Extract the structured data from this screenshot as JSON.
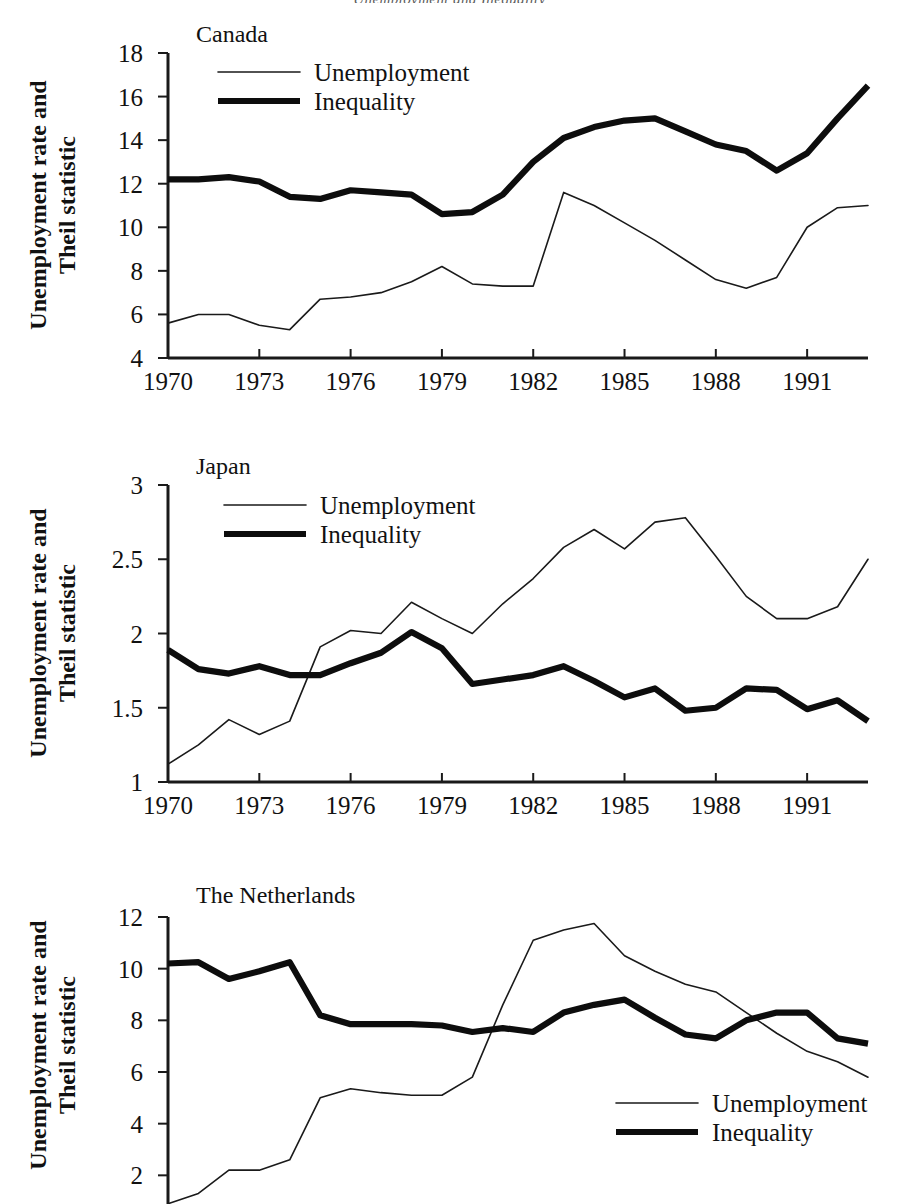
{
  "document": {
    "running_header": "Unemployment and Inequality"
  },
  "common": {
    "y_axis_title_line1": "Unemployment rate and",
    "y_axis_title_line2": "Theil statistic",
    "legend": {
      "unemployment_label": "Unemployment",
      "inequality_label": "Inequality",
      "unemployment_swatch": "thin-line-swatch",
      "inequality_swatch": "thick-line-swatch"
    },
    "x_tick_labels": [
      "1970",
      "1973",
      "1976",
      "1979",
      "1982",
      "1985",
      "1988",
      "1991"
    ],
    "colors": {
      "ink": "#111111",
      "unemployment_line": "#1a1a1a",
      "inequality_line": "#0d0d0d",
      "background": "#ffffff"
    }
  },
  "chart_data": [
    {
      "type": "line",
      "title": "Canada",
      "xlabel": "",
      "ylabel": "Unemployment rate and Theil statistic",
      "xlim": [
        1970,
        1993
      ],
      "ylim": [
        4,
        18
      ],
      "y_ticks": [
        4,
        6,
        8,
        10,
        12,
        14,
        16,
        18
      ],
      "x_ticks": [
        1970,
        1973,
        1976,
        1979,
        1982,
        1985,
        1988,
        1991
      ],
      "grid": false,
      "legend_position": "top-left-inside",
      "x": [
        1970,
        1971,
        1972,
        1973,
        1974,
        1975,
        1976,
        1977,
        1978,
        1979,
        1980,
        1981,
        1982,
        1983,
        1984,
        1985,
        1986,
        1987,
        1988,
        1989,
        1990,
        1991,
        1992,
        1993
      ],
      "series": [
        {
          "name": "Unemployment",
          "values": [
            5.6,
            6.0,
            6.0,
            5.5,
            5.3,
            6.7,
            6.8,
            7.0,
            7.5,
            8.2,
            7.4,
            7.3,
            7.3,
            11.6,
            11.0,
            10.2,
            9.4,
            8.5,
            7.6,
            7.2,
            7.7,
            10.0,
            10.9,
            11.0
          ]
        },
        {
          "name": "Inequality",
          "values": [
            12.2,
            12.2,
            12.3,
            12.1,
            11.4,
            11.3,
            11.7,
            11.6,
            11.5,
            10.6,
            10.7,
            11.5,
            13.0,
            14.1,
            14.6,
            14.9,
            15.0,
            14.4,
            13.8,
            13.5,
            12.6,
            13.4,
            15.0,
            16.5
          ]
        }
      ]
    },
    {
      "type": "line",
      "title": "Japan",
      "xlabel": "",
      "ylabel": "Unemployment rate and Theil statistic",
      "xlim": [
        1970,
        1993
      ],
      "ylim": [
        1,
        3
      ],
      "y_ticks": [
        1,
        1.5,
        2,
        2.5,
        3
      ],
      "y_tick_labels": [
        "1",
        "1.5",
        "2",
        "2.5",
        "3"
      ],
      "x_ticks": [
        1970,
        1973,
        1976,
        1979,
        1982,
        1985,
        1988,
        1991
      ],
      "grid": false,
      "legend_position": "top-left-inside",
      "x": [
        1970,
        1971,
        1972,
        1973,
        1974,
        1975,
        1976,
        1977,
        1978,
        1979,
        1980,
        1981,
        1982,
        1983,
        1984,
        1985,
        1986,
        1987,
        1988,
        1989,
        1990,
        1991,
        1992,
        1993
      ],
      "series": [
        {
          "name": "Unemployment",
          "values": [
            1.12,
            1.25,
            1.42,
            1.32,
            1.41,
            1.91,
            2.02,
            2.0,
            2.21,
            2.1,
            2.0,
            2.2,
            2.37,
            2.58,
            2.7,
            2.57,
            2.75,
            2.78,
            2.52,
            2.25,
            2.1,
            2.1,
            2.18,
            2.5
          ]
        },
        {
          "name": "Inequality",
          "values": [
            1.89,
            1.76,
            1.73,
            1.78,
            1.72,
            1.72,
            1.8,
            1.87,
            2.01,
            1.9,
            1.66,
            1.69,
            1.72,
            1.78,
            1.68,
            1.57,
            1.63,
            1.48,
            1.5,
            1.63,
            1.62,
            1.49,
            1.55,
            1.41
          ]
        }
      ]
    },
    {
      "type": "line",
      "title": "The Netherlands",
      "xlabel": "",
      "ylabel": "Unemployment rate and Theil statistic",
      "xlim": [
        1970,
        1993
      ],
      "ylim": [
        0,
        12
      ],
      "y_ticks": [
        2,
        4,
        6,
        8,
        10,
        12
      ],
      "x_ticks": [
        1970,
        1973,
        1976,
        1979,
        1982,
        1985,
        1988,
        1991
      ],
      "grid": false,
      "legend_position": "bottom-right-inside",
      "note": "x-axis and its tick labels are cropped off the bottom of the scanned page",
      "x": [
        1970,
        1971,
        1972,
        1973,
        1974,
        1975,
        1976,
        1977,
        1978,
        1979,
        1980,
        1981,
        1982,
        1983,
        1984,
        1985,
        1986,
        1987,
        1988,
        1989,
        1990,
        1991,
        1992,
        1993
      ],
      "series": [
        {
          "name": "Unemployment",
          "values": [
            0.9,
            1.3,
            2.2,
            2.2,
            2.6,
            5.0,
            5.35,
            5.2,
            5.1,
            5.1,
            5.8,
            8.6,
            11.1,
            11.5,
            11.75,
            10.5,
            9.9,
            9.4,
            9.1,
            8.3,
            7.5,
            6.8,
            6.4,
            5.8
          ]
        },
        {
          "name": "Inequality",
          "values": [
            10.2,
            10.25,
            9.6,
            9.9,
            10.25,
            8.2,
            7.85,
            7.85,
            7.85,
            7.8,
            7.55,
            7.7,
            7.55,
            8.3,
            8.6,
            8.8,
            8.1,
            7.45,
            7.3,
            8.0,
            8.3,
            8.3,
            7.3,
            7.1,
            7.5
          ]
        }
      ]
    }
  ]
}
